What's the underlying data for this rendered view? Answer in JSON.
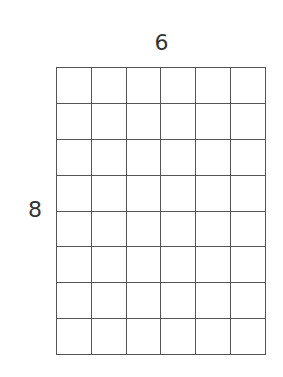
{
  "diagram": {
    "type": "rectangular-grid",
    "columns_label": "6",
    "rows_label": "8",
    "columns": 6,
    "rows": 8,
    "line_color": "#555555",
    "background": "#ffffff"
  }
}
